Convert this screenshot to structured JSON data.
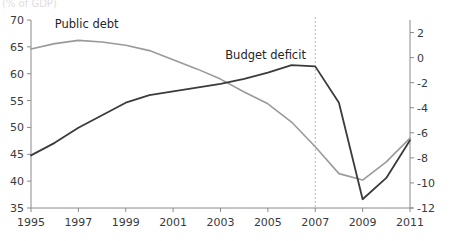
{
  "chart_data": {
    "type": "line",
    "title": "",
    "subtitle": "",
    "unit_note": "(% of GDP)",
    "xlabel": "",
    "ylabel": "",
    "x": [
      1995,
      1996,
      1997,
      1998,
      1999,
      2000,
      2001,
      2002,
      2003,
      2004,
      2005,
      2006,
      2007,
      2008,
      2009,
      2010,
      2011
    ],
    "xlim": [
      1995,
      2011
    ],
    "x_tick_labels": [
      "1995",
      "1997",
      "1999",
      "2001",
      "2003",
      "2005",
      "2007",
      "2009",
      "2011"
    ],
    "x_tick_values": [
      1995,
      1997,
      1999,
      2001,
      2003,
      2005,
      2007,
      2009,
      2011
    ],
    "grid": false,
    "legend_position": "inline-annotations",
    "annotations": [
      {
        "text": "Public debt",
        "series": "Public debt",
        "x": 1996,
        "y": 68.6
      },
      {
        "text": "Budget deficit",
        "series": "Budget deficit",
        "x": 2003.2,
        "y": 62.8
      }
    ],
    "reference_lines": [
      {
        "x": 2007,
        "style": "dashed",
        "color": "#b9b9b9"
      }
    ],
    "axes": {
      "left": {
        "name": "Public debt axis",
        "ylim": [
          35,
          70
        ],
        "ticks": [
          35,
          40,
          45,
          50,
          55,
          60,
          65,
          70
        ],
        "tick_labels": [
          "35",
          "40",
          "45",
          "50",
          "55",
          "60",
          "65",
          "70"
        ]
      },
      "right": {
        "name": "Budget deficit axis",
        "ylim": [
          -12,
          3
        ],
        "ticks": [
          -12,
          -10,
          -8,
          -6,
          -4,
          -2,
          0,
          2
        ],
        "tick_labels": [
          "-12",
          "-10",
          "-8",
          "-6",
          "-4",
          "-2",
          "0",
          "2"
        ]
      }
    },
    "series": [
      {
        "name": "Public debt",
        "axis": "left",
        "color": "#9a9a9a",
        "style": "solid",
        "values": [
          64.6,
          65.6,
          66.2,
          65.9,
          65.3,
          64.3,
          62.6,
          60.9,
          59.0,
          56.6,
          54.4,
          51.0,
          46.4,
          41.4,
          40.2,
          43.6,
          48.0
        ]
      },
      {
        "name": "Budget deficit",
        "axis": "right",
        "color": "#3b3b3b",
        "style": "solid",
        "values": [
          -7.8,
          -6.8,
          -5.6,
          -4.6,
          -3.6,
          -3.0,
          -2.7,
          -2.4,
          -2.1,
          -1.7,
          -1.2,
          -0.6,
          -0.7,
          -3.6,
          -11.3,
          -9.6,
          -6.6
        ]
      }
    ]
  }
}
